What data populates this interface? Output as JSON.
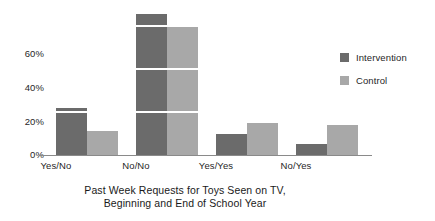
{
  "chart_data": {
    "type": "bar",
    "title": "",
    "xlabel": "Past Week Requests for Toys Seen on TV, Beginning and End of School Year",
    "xlabel_line1": "Past Week Requests for Toys Seen on TV,",
    "xlabel_line2": "Beginning and End of School Year",
    "ylabel": "",
    "categories": [
      "Yes/No",
      "No/No",
      "Yes/Yes",
      "No/Yes"
    ],
    "series": [
      {
        "name": "Intervention",
        "color": "#6b6b6b",
        "values": [
          22,
          66,
          10,
          5
        ]
      },
      {
        "name": "Control",
        "color": "#a8a8a8",
        "values": [
          11,
          60,
          15,
          14
        ]
      }
    ],
    "ylim": [
      0,
      70
    ],
    "yticks": [
      0,
      20,
      40,
      60
    ],
    "ytick_labels": [
      "0%",
      "20%",
      "40%",
      "60%"
    ],
    "grid": true,
    "grid_color": "#ffffff",
    "legend_position": "right",
    "axis_color": "#8a8a8a",
    "background": "#ffffff"
  },
  "legend": {
    "items": [
      {
        "label": "Intervention",
        "color": "#6b6b6b"
      },
      {
        "label": "Control",
        "color": "#a8a8a8"
      }
    ]
  }
}
